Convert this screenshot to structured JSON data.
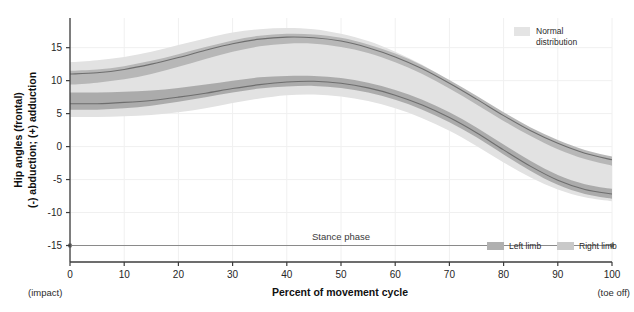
{
  "chart_data": {
    "type": "area",
    "title": "",
    "xlabel": "Percent of movement cycle",
    "ylabel_line1": "Hip angles (frontal)",
    "ylabel_line2": "(-) abduction; (+) adduction",
    "xlim": [
      0,
      100
    ],
    "ylim": [
      -17.5,
      19.5
    ],
    "xticks": [
      0,
      10,
      20,
      30,
      40,
      50,
      60,
      70,
      80,
      90,
      100
    ],
    "xtick_labels": [
      "0",
      "10",
      "20",
      "30",
      "40",
      "50",
      "60",
      "70",
      "80",
      "90",
      "100"
    ],
    "yticks": [
      15,
      10,
      5,
      0,
      -5,
      -10,
      -15
    ],
    "ytick_labels": [
      "15",
      "10",
      "5",
      "0",
      "-5",
      "-10",
      "-15"
    ],
    "x_start_note": "(impact)",
    "x_end_note": "(toe off)",
    "grid": true,
    "legend_position": "top-right and bottom-right",
    "x": [
      0,
      5,
      10,
      15,
      20,
      25,
      30,
      35,
      40,
      45,
      50,
      55,
      60,
      65,
      70,
      75,
      80,
      85,
      90,
      95,
      100
    ],
    "series": [
      {
        "name": "Normal distribution",
        "role": "band",
        "color": "#e2e2e2",
        "upper": [
          12.8,
          13.1,
          13.6,
          14.4,
          15.4,
          16.4,
          17.3,
          17.8,
          18.0,
          17.8,
          17.1,
          16.0,
          14.4,
          12.4,
          10.0,
          7.3,
          4.6,
          2.2,
          0.3,
          -0.9,
          -1.6
        ],
        "lower": [
          4.5,
          4.5,
          4.6,
          4.8,
          5.2,
          5.8,
          6.6,
          7.3,
          7.8,
          7.9,
          7.6,
          6.9,
          5.8,
          4.3,
          2.4,
          0.1,
          -2.4,
          -4.7,
          -6.5,
          -7.7,
          -8.3
        ]
      },
      {
        "name": "Left limb",
        "role": "band-mean",
        "color": "#b4b4b4",
        "mean": [
          11.0,
          11.2,
          11.7,
          12.5,
          13.5,
          14.6,
          15.6,
          16.3,
          16.6,
          16.5,
          16.0,
          15.0,
          13.6,
          11.8,
          9.6,
          7.2,
          4.7,
          2.4,
          0.5,
          -1.0,
          -2.0
        ],
        "upper": [
          11.5,
          11.7,
          12.2,
          13.0,
          14.0,
          15.1,
          16.1,
          16.8,
          17.1,
          17.0,
          16.5,
          15.5,
          14.1,
          12.3,
          10.1,
          7.7,
          5.2,
          2.9,
          1.0,
          -0.5,
          -1.5
        ],
        "lower": [
          9.4,
          9.7,
          10.2,
          11.0,
          12.1,
          13.3,
          14.4,
          15.2,
          15.6,
          15.6,
          15.1,
          14.2,
          12.8,
          11.0,
          8.8,
          6.4,
          3.9,
          1.6,
          -0.4,
          -1.9,
          -2.9
        ]
      },
      {
        "name": "Right limb",
        "role": "band-mean",
        "color": "#a8a8a8",
        "mean": [
          6.5,
          6.5,
          6.7,
          7.0,
          7.5,
          8.1,
          8.8,
          9.4,
          9.8,
          9.9,
          9.6,
          8.9,
          7.8,
          6.3,
          4.4,
          2.1,
          -0.5,
          -3.0,
          -5.1,
          -6.5,
          -7.2
        ],
        "upper": [
          8.2,
          8.2,
          8.3,
          8.5,
          8.9,
          9.4,
          10.0,
          10.5,
          10.7,
          10.7,
          10.4,
          9.7,
          8.6,
          7.1,
          5.2,
          2.9,
          0.3,
          -2.2,
          -4.3,
          -5.7,
          -6.4
        ],
        "lower": [
          5.6,
          5.6,
          5.8,
          6.2,
          6.8,
          7.5,
          8.2,
          8.8,
          9.1,
          9.2,
          8.9,
          8.2,
          7.1,
          5.6,
          3.7,
          1.4,
          -1.2,
          -3.7,
          -5.8,
          -7.2,
          -7.9
        ]
      }
    ],
    "annotations": [
      {
        "name": "stance-phase",
        "label": "Stance phase",
        "y": -15,
        "x_start": 0,
        "x_end": 100,
        "endpoint_marker": "dot"
      }
    ]
  },
  "legend": {
    "normal": {
      "label_line1": "Normal",
      "label_line2": "distribution",
      "swatch_color": "#e4e4e4"
    },
    "left_limb": {
      "label": "Left limb",
      "swatch_color": "#b0b0b0"
    },
    "right_limb": {
      "label": "Right limb",
      "swatch_color": "#c9c9c9"
    }
  },
  "colors": {
    "background": "#ffffff",
    "axis": "#3c3c3c",
    "grid": "#f0f0f0",
    "band_normal": "#e2e2e2",
    "band_left": "#b4b4b4",
    "band_right": "#aaaaaa",
    "mean_line": "#6e6e6e",
    "annotation_line": "#8a8a8a",
    "text": "#1a1a1a"
  }
}
